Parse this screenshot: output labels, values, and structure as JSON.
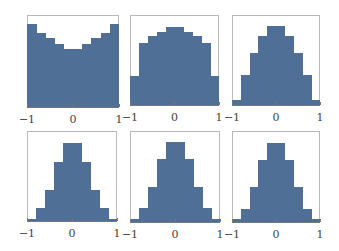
{
  "chart_data": [
    {
      "type": "bar",
      "title": "",
      "xlabel": "",
      "ylabel": "",
      "xlim": [
        -1,
        1
      ],
      "bins": [
        -1,
        -0.8,
        -0.6,
        -0.4,
        -0.2,
        0,
        0.2,
        0.4,
        0.6,
        0.8,
        1
      ],
      "xticks": [
        "−1",
        "0",
        "1"
      ],
      "values": [
        83,
        74,
        69,
        63,
        58,
        58,
        63,
        69,
        74,
        83
      ]
    },
    {
      "type": "bar",
      "title": "",
      "xlabel": "",
      "ylabel": "",
      "xlim": [
        -1,
        1
      ],
      "bins": [
        -1,
        -0.8,
        -0.6,
        -0.4,
        -0.2,
        0,
        0.2,
        0.4,
        0.6,
        0.8,
        1
      ],
      "xticks": [
        "−1",
        "0",
        "1"
      ],
      "values": [
        30,
        63,
        71,
        75,
        80,
        80,
        75,
        71,
        63,
        30
      ]
    },
    {
      "type": "bar",
      "title": "",
      "xlabel": "",
      "ylabel": "",
      "xlim": [
        -1,
        1
      ],
      "bins": [
        -1,
        -0.8,
        -0.6,
        -0.4,
        -0.2,
        0,
        0.2,
        0.4,
        0.6,
        0.8,
        1
      ],
      "xticks": [
        "−1",
        "0",
        "1"
      ],
      "values": [
        5,
        31,
        53,
        71,
        81,
        81,
        71,
        53,
        31,
        5
      ]
    },
    {
      "type": "bar",
      "title": "",
      "xlabel": "",
      "ylabel": "",
      "xlim": [
        -1,
        1
      ],
      "bins": [
        -1,
        -0.8,
        -0.6,
        -0.4,
        -0.2,
        0,
        0.2,
        0.4,
        0.6,
        0.8,
        1
      ],
      "xticks": [
        "−1",
        "0",
        "1"
      ],
      "values": [
        2,
        13,
        32,
        60,
        80,
        80,
        60,
        32,
        13,
        2
      ]
    },
    {
      "type": "bar",
      "title": "",
      "xlabel": "",
      "ylabel": "",
      "xlim": [
        -1,
        1
      ],
      "bins": [
        -1,
        -0.8,
        -0.6,
        -0.4,
        -0.2,
        0,
        0.2,
        0.4,
        0.6,
        0.8,
        1
      ],
      "xticks": [
        "−1",
        "0",
        "1"
      ],
      "values": [
        3,
        14,
        35,
        64,
        81,
        81,
        64,
        35,
        14,
        3
      ]
    },
    {
      "type": "bar",
      "title": "",
      "xlabel": "",
      "ylabel": "",
      "xlim": [
        -1,
        1
      ],
      "bins": [
        -1,
        -0.8,
        -0.6,
        -0.4,
        -0.2,
        0,
        0.2,
        0.4,
        0.6,
        0.8,
        1
      ],
      "xticks": [
        "−1",
        "0",
        "1"
      ],
      "values": [
        3,
        13,
        35,
        63,
        80,
        80,
        63,
        35,
        13,
        3
      ]
    }
  ],
  "layout": {
    "bar_color": "#4f6f97",
    "frame_color": "#b9b9b9",
    "panels": [
      {
        "left": 27,
        "top": 15,
        "width": 92,
        "height": 92
      },
      {
        "left": 130,
        "top": 15,
        "width": 89,
        "height": 90
      },
      {
        "left": 232,
        "top": 15,
        "width": 88,
        "height": 90
      },
      {
        "left": 27,
        "top": 131,
        "width": 90,
        "height": 90
      },
      {
        "left": 130,
        "top": 131,
        "width": 90,
        "height": 91
      },
      {
        "left": 232,
        "top": 131,
        "width": 88,
        "height": 91
      }
    ],
    "ymax": 92
  }
}
